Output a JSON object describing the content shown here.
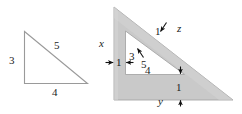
{
  "figure": {
    "background_color": "#ffffff",
    "stroke_color": "#8f8f8f",
    "frame_fill_color": "#c9c9c9",
    "frame_shade_color": "#d6d6d6",
    "text_color": "#1b1b1b",
    "arrow_color": "#111111"
  },
  "left_triangle": {
    "name": "3-4-5 right triangle",
    "labels": {
      "vertical_leg": "3",
      "hypotenuse": "5",
      "horizontal_leg": "4"
    }
  },
  "right_figure": {
    "name": "triangular frame of uniform width",
    "labels": {
      "outer_left_side": "x",
      "outer_hypotenuse": "z",
      "outer_bottom": "y",
      "inner_vertical_leg": "3",
      "inner_hypotenuse": "5",
      "inner_bottom_leg": "4",
      "thickness_left": "1",
      "thickness_hypotenuse": "1",
      "thickness_bottom": "1"
    }
  }
}
